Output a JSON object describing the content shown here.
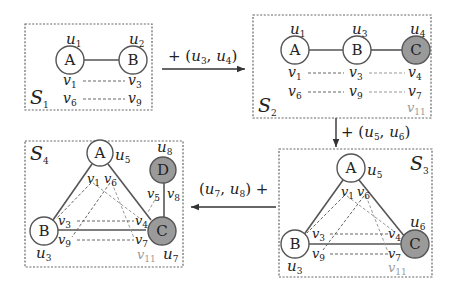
{
  "colors": {
    "node_new_fill": "#9a9a9a",
    "node_fill": "#ffffff",
    "stroke": "#555555",
    "faded_label": "#999999"
  },
  "panels": {
    "s1": {
      "title": "S",
      "title_sub": "1",
      "nodes": [
        {
          "letter": "A",
          "u": "u",
          "u_sub": "1"
        },
        {
          "letter": "B",
          "u": "u",
          "u_sub": "2"
        }
      ],
      "v_labels": [
        {
          "v": "v",
          "sub": "1"
        },
        {
          "v": "v",
          "sub": "3"
        },
        {
          "v": "v",
          "sub": "6"
        },
        {
          "v": "v",
          "sub": "9"
        }
      ]
    },
    "s2": {
      "title": "S",
      "title_sub": "2",
      "nodes": [
        {
          "letter": "A",
          "u": "u",
          "u_sub": "1"
        },
        {
          "letter": "B",
          "u": "u",
          "u_sub": "3"
        },
        {
          "letter": "C",
          "u": "u",
          "u_sub": "4"
        }
      ],
      "v_labels": [
        {
          "v": "v",
          "sub": "1"
        },
        {
          "v": "v",
          "sub": "3"
        },
        {
          "v": "v",
          "sub": "4"
        },
        {
          "v": "v",
          "sub": "6"
        },
        {
          "v": "v",
          "sub": "9"
        },
        {
          "v": "v",
          "sub": "7"
        },
        {
          "v": "v",
          "sub": "11"
        }
      ]
    },
    "s3": {
      "title": "S",
      "title_sub": "3",
      "nodes": [
        {
          "letter": "A",
          "u": "u",
          "u_sub": "5"
        },
        {
          "letter": "B",
          "u": "u",
          "u_sub": "3"
        },
        {
          "letter": "C",
          "u": "u",
          "u_sub": "6"
        }
      ],
      "v_labels": [
        {
          "v": "v",
          "sub": "1"
        },
        {
          "v": "v",
          "sub": "6"
        },
        {
          "v": "v",
          "sub": "3"
        },
        {
          "v": "v",
          "sub": "4"
        },
        {
          "v": "v",
          "sub": "9"
        },
        {
          "v": "v",
          "sub": "7"
        },
        {
          "v": "v",
          "sub": "11"
        }
      ]
    },
    "s4": {
      "title": "S",
      "title_sub": "4",
      "nodes": [
        {
          "letter": "A",
          "u": "u",
          "u_sub": "5"
        },
        {
          "letter": "B",
          "u": "u",
          "u_sub": "3"
        },
        {
          "letter": "C",
          "u": "u",
          "u_sub": "7"
        },
        {
          "letter": "D",
          "u": "u",
          "u_sub": "8"
        }
      ],
      "v_labels": [
        {
          "v": "v",
          "sub": "1"
        },
        {
          "v": "v",
          "sub": "6"
        },
        {
          "v": "v",
          "sub": "5"
        },
        {
          "v": "v",
          "sub": "8"
        },
        {
          "v": "v",
          "sub": "3"
        },
        {
          "v": "v",
          "sub": "4"
        },
        {
          "v": "v",
          "sub": "9"
        },
        {
          "v": "v",
          "sub": "7"
        },
        {
          "v": "v",
          "sub": "11"
        }
      ]
    }
  },
  "transitions": {
    "t1": {
      "prefix": "+ (",
      "a": "u",
      "a_sub": "3",
      "sep": ", ",
      "b": "u",
      "b_sub": "4",
      "suffix": ")"
    },
    "t2": {
      "prefix": "+ (",
      "a": "u",
      "a_sub": "5",
      "sep": ", ",
      "b": "u",
      "b_sub": "6",
      "suffix": ")"
    },
    "t3": {
      "prefix": "(",
      "a": "u",
      "a_sub": "7",
      "sep": ", ",
      "b": "u",
      "b_sub": "8",
      "suffix": ") +"
    }
  }
}
